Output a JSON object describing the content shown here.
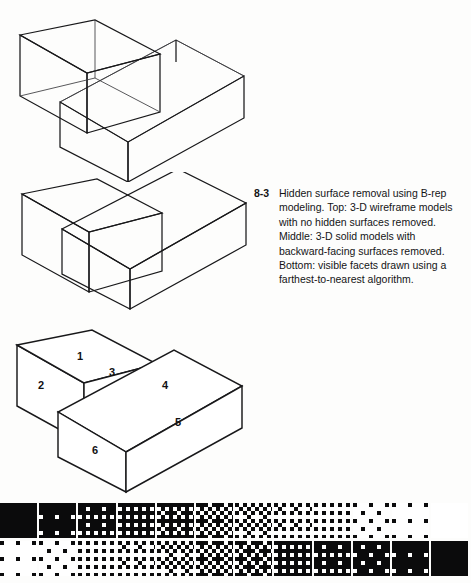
{
  "figure": {
    "number": "8-3",
    "caption": "Hidden surface removal using B-rep modeling. Top: 3-D wireframe models with no hidden surfaces removed. Middle: 3-D solid models with backward-facing surfaces removed. Bottom: visible facets drawn using a farthest-to-nearest algorithm.",
    "panels": [
      {
        "id": "wireframe",
        "name": "top-wireframe-panel",
        "description": "3-D wireframe models with no hidden surfaces removed"
      },
      {
        "id": "solid",
        "name": "middle-solid-panel",
        "description": "3-D solid models with backward-facing surfaces removed"
      },
      {
        "id": "facets",
        "name": "bottom-facets-panel",
        "description": "Visible facets drawn using a farthest-to-nearest algorithm"
      }
    ]
  },
  "facet_labels": [
    {
      "id": "1",
      "label": "1",
      "face": "small-box-top"
    },
    {
      "id": "2",
      "label": "2",
      "face": "small-box-left"
    },
    {
      "id": "3",
      "label": "3",
      "face": "small-box-front"
    },
    {
      "id": "4",
      "label": "4",
      "face": "long-box-top"
    },
    {
      "id": "5",
      "label": "5",
      "face": "long-box-front-right"
    },
    {
      "id": "6",
      "label": "6",
      "face": "long-box-front-left"
    }
  ],
  "colors": {
    "page_background": "#fdfdfc",
    "ink": "#18181a",
    "face_fill": "#ffffff",
    "swatch_ink": "#0b0b0c"
  },
  "swatches": {
    "columns": 12,
    "top_row": {
      "name": "dither-ramp-dark-to-light",
      "densities": [
        100,
        93,
        84,
        75,
        66,
        57,
        45,
        34,
        24,
        15,
        8,
        3
      ]
    },
    "bottom_row": {
      "name": "dither-ramp-light-to-dark",
      "densities": [
        5,
        13,
        22,
        32,
        43,
        54,
        64,
        73,
        82,
        89,
        95,
        100
      ]
    }
  }
}
